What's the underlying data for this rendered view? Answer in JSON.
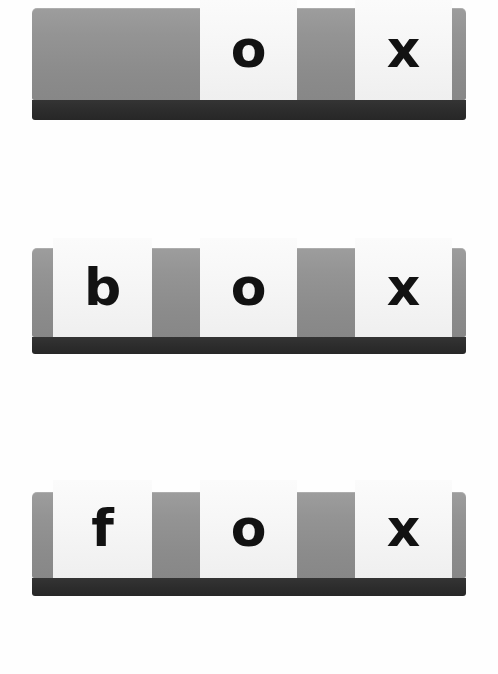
{
  "page": {
    "background_color": "#ffffff",
    "width": 498,
    "height": 674
  },
  "palette": {
    "board_gray_top": "#9d9d9d",
    "board_gray_bottom": "#878787",
    "board_base_dark": "#2c2c2c",
    "tile_white": "#f7f7f7",
    "letter_black": "#121212"
  },
  "rows": [
    {
      "id": "row-1",
      "word": "ox",
      "board": {
        "x": 32,
        "y": 8,
        "width": 434,
        "height": 92
      },
      "base": {
        "x": 32,
        "y": 100,
        "width": 434,
        "height": 20
      },
      "slots": [
        {
          "index": 0,
          "letter": "",
          "filled": false,
          "x": 53,
          "y": 0,
          "width": 99,
          "height": 0
        },
        {
          "index": 1,
          "letter": "",
          "filled": false,
          "x": 200,
          "y": 0,
          "width": 97,
          "height": 0
        },
        {
          "index": 2,
          "letter": "o",
          "filled": true,
          "x": 200,
          "y": 0,
          "width": 97,
          "height": 100
        },
        {
          "index": 3,
          "letter": "x",
          "filled": true,
          "x": 355,
          "y": 0,
          "width": 97,
          "height": 100
        }
      ],
      "tiles": [
        {
          "letter": "o",
          "x": 200,
          "y": 0,
          "width": 97,
          "height": 100,
          "font_size": 52
        },
        {
          "letter": "x",
          "x": 355,
          "y": 0,
          "width": 97,
          "height": 100,
          "font_size": 52
        }
      ]
    },
    {
      "id": "row-2",
      "word": "box",
      "board": {
        "x": 32,
        "y": 248,
        "width": 434,
        "height": 89
      },
      "base": {
        "x": 32,
        "y": 337,
        "width": 434,
        "height": 17
      },
      "tiles": [
        {
          "letter": "b",
          "x": 53,
          "y": 238,
          "width": 99,
          "height": 99,
          "font_size": 52
        },
        {
          "letter": "o",
          "x": 200,
          "y": 238,
          "width": 97,
          "height": 99,
          "font_size": 52
        },
        {
          "letter": "x",
          "x": 355,
          "y": 238,
          "width": 97,
          "height": 99,
          "font_size": 52
        }
      ]
    },
    {
      "id": "row-3",
      "word": "fox",
      "board": {
        "x": 32,
        "y": 492,
        "width": 434,
        "height": 86
      },
      "base": {
        "x": 32,
        "y": 578,
        "width": 434,
        "height": 18
      },
      "tiles": [
        {
          "letter": "f",
          "x": 53,
          "y": 480,
          "width": 99,
          "height": 98,
          "font_size": 52
        },
        {
          "letter": "o",
          "x": 200,
          "y": 480,
          "width": 97,
          "height": 98,
          "font_size": 52
        },
        {
          "letter": "x",
          "x": 355,
          "y": 480,
          "width": 97,
          "height": 98,
          "font_size": 52
        }
      ]
    }
  ]
}
